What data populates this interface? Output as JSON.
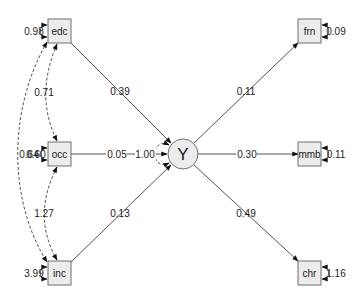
{
  "diagram": {
    "type": "path-diagram",
    "nodes": [
      {
        "id": "edc",
        "label": "edc",
        "shape": "rect",
        "cx": 60,
        "cy": 31
      },
      {
        "id": "occ",
        "label": "occ",
        "shape": "rect",
        "cx": 60,
        "cy": 154
      },
      {
        "id": "inc",
        "label": "inc",
        "shape": "rect",
        "cx": 60,
        "cy": 273
      },
      {
        "id": "Y",
        "label": "Y",
        "shape": "circle",
        "cx": 183,
        "cy": 154
      },
      {
        "id": "frn",
        "label": "frn",
        "shape": "rect",
        "cx": 310,
        "cy": 31
      },
      {
        "id": "mmb",
        "label": "mmb",
        "shape": "rect",
        "cx": 310,
        "cy": 154
      },
      {
        "id": "chr",
        "label": "chr",
        "shape": "rect",
        "cx": 310,
        "cy": 273
      }
    ],
    "paths": [
      {
        "from": "edc",
        "to": "Y",
        "value": "0.39"
      },
      {
        "from": "occ",
        "to": "Y",
        "value": "0.05"
      },
      {
        "from": "inc",
        "to": "Y",
        "value": "0.13"
      },
      {
        "from": "Y",
        "to": "frn",
        "value": "0.11"
      },
      {
        "from": "Y",
        "to": "mmb",
        "value": "0.30"
      },
      {
        "from": "Y",
        "to": "chr",
        "value": "0.49"
      }
    ],
    "covariances": [
      {
        "a": "edc",
        "b": "occ",
        "value": "0.71"
      },
      {
        "a": "occ",
        "b": "inc",
        "value": "1.27"
      },
      {
        "a": "edc",
        "b": "inc",
        "value": "0.64"
      }
    ],
    "variances": [
      {
        "node": "edc",
        "value": "0.98"
      },
      {
        "node": "occ",
        "value": "0.60"
      },
      {
        "node": "inc",
        "value": "3.99"
      },
      {
        "node": "Y",
        "value": "1.00"
      },
      {
        "node": "frn",
        "value": "0.09"
      },
      {
        "node": "mmb",
        "value": "0.11"
      },
      {
        "node": "chr",
        "value": "1.16"
      }
    ]
  }
}
